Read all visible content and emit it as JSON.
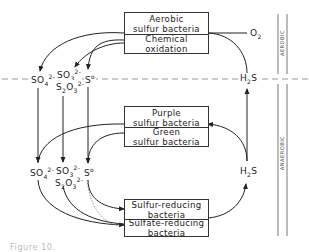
{
  "diagram": {
    "zones": {
      "aerobic": "AEROBIC",
      "anaerobic": "ANAEROBIC"
    },
    "boxes": {
      "top": {
        "upper": [
          "Aerobic",
          "sulfur bacteria"
        ],
        "lower": [
          "Chemical",
          "oxidation"
        ]
      },
      "middle": {
        "upper": [
          "Purple",
          "sulfur bacteria"
        ],
        "lower": [
          "Green",
          "sulfur bacteria"
        ]
      },
      "bottom": {
        "upper": [
          "Sulfur-reducing",
          "bacteria"
        ],
        "lower": [
          "Sulfate-reducing",
          "bacteria"
        ]
      }
    },
    "species": {
      "sulfate": {
        "base": "SO",
        "sub": "4",
        "sup": "2-"
      },
      "sulfite": {
        "base": "SO",
        "sub": "3",
        "sup": "2-"
      },
      "thiosulfate": {
        "s": "S",
        "s_sub": "2",
        "o": "O",
        "o_sub": "3",
        "sup": "2-"
      },
      "sulfur": {
        "base": "S",
        "sup": "o"
      },
      "hydrogen_sulfide": {
        "h": "H",
        "h_sub": "2",
        "s": "S"
      },
      "oxygen": {
        "base": "O",
        "sub": "2"
      }
    },
    "edges": [
      {
        "from": "Aerobic sulfur bacteria / Chemical oxidation",
        "to": "SO4 2- (upper)"
      },
      {
        "from": "Aerobic sulfur bacteria / Chemical oxidation",
        "to": "SO3 2- / S2O3 2- (upper)"
      },
      {
        "from": "Aerobic sulfur bacteria / Chemical oxidation",
        "to": "S0 (upper)"
      },
      {
        "from": "O2",
        "to": "Aerobic sulfur bacteria"
      },
      {
        "from": "H2S (upper)",
        "to": "Aerobic sulfur bacteria / Chemical oxidation"
      },
      {
        "from": "SO4 2- (upper)",
        "to": "SO4 2- (lower)"
      },
      {
        "from": "SO3 2- (upper)",
        "to": "SO3 2- (lower)"
      },
      {
        "from": "S0 (upper)",
        "to": "S0 (lower)"
      },
      {
        "from": "Purple / Green sulfur bacteria",
        "to": "SO4 2- (lower)"
      },
      {
        "from": "Purple / Green sulfur bacteria",
        "to": "S0 (lower)"
      },
      {
        "from": "H2S (lower)",
        "to": "Purple / Green sulfur bacteria"
      },
      {
        "from": "H2S (lower)",
        "to": "H2S (upper)"
      },
      {
        "from": "S0 (lower)",
        "to": "Sulfur-reducing bacteria"
      },
      {
        "from": "SO4 2- (lower)",
        "to": "Sulfate-reducing bacteria"
      },
      {
        "from": "SO3 2- / S2O3 2- (lower)",
        "to": "Sulfate-reducing bacteria"
      },
      {
        "from": "S0 (lower)",
        "to": "Sulfate-reducing bacteria",
        "style": "dotted"
      },
      {
        "from": "Sulfur-/Sulfate-reducing bacteria",
        "to": "H2S (lower)"
      }
    ]
  },
  "caption": {
    "text": "Figure 10."
  }
}
